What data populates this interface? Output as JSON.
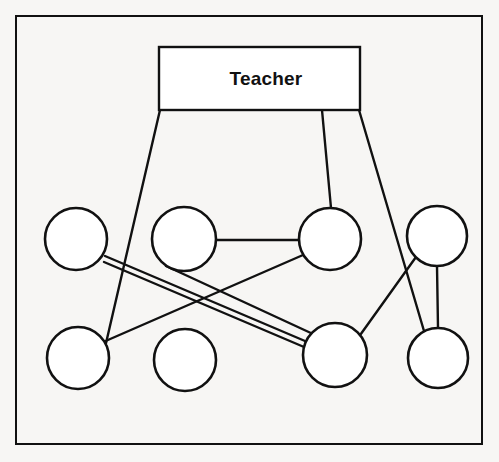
{
  "figure": {
    "kind": "node-link-diagram",
    "background_color": "#f7f6f4",
    "stroke_color": "#111111",
    "fill_color": "#ffffff",
    "border": {
      "x": 16,
      "y": 16,
      "width": 466,
      "height": 428,
      "stroke_width": 2
    }
  },
  "boxes": [
    {
      "id": "teacher",
      "label": "Teacher",
      "x": 159,
      "y": 47,
      "width": 201,
      "height": 63,
      "label_x": 266,
      "label_y": 68,
      "stroke_width": 2.4
    }
  ],
  "circles": [
    {
      "id": "t1",
      "row": "top",
      "index": 1,
      "cx": 76,
      "cy": 239,
      "r": 31,
      "stroke_width": 2.6
    },
    {
      "id": "t2",
      "row": "top",
      "index": 2,
      "cx": 184,
      "cy": 239,
      "r": 32,
      "stroke_width": 2.6
    },
    {
      "id": "t3",
      "row": "top",
      "index": 3,
      "cx": 330,
      "cy": 239,
      "r": 31,
      "stroke_width": 2.6
    },
    {
      "id": "t4",
      "row": "top",
      "index": 4,
      "cx": 437,
      "cy": 236,
      "r": 30,
      "stroke_width": 2.6
    },
    {
      "id": "b1",
      "row": "bottom",
      "index": 1,
      "cx": 78,
      "cy": 358,
      "r": 31,
      "stroke_width": 2.6
    },
    {
      "id": "b2",
      "row": "bottom",
      "index": 2,
      "cx": 185,
      "cy": 360,
      "r": 31,
      "stroke_width": 2.6
    },
    {
      "id": "b3",
      "row": "bottom",
      "index": 3,
      "cx": 335,
      "cy": 355,
      "r": 32,
      "stroke_width": 2.6
    },
    {
      "id": "b4",
      "row": "bottom",
      "index": 4,
      "cx": 438,
      "cy": 358,
      "r": 30,
      "stroke_width": 2.6
    }
  ],
  "edges": [
    {
      "id": "e1",
      "from": "teacher",
      "to": "b1",
      "x1": 160,
      "y1": 110,
      "x2": 97,
      "y2": 382,
      "stroke_width": 2.4
    },
    {
      "id": "e2",
      "from": "teacher",
      "to": "t3",
      "x1": 322,
      "y1": 110,
      "x2": 331,
      "y2": 208,
      "stroke_width": 2.4
    },
    {
      "id": "e3",
      "from": "teacher",
      "to": "b4",
      "x1": 359,
      "y1": 110,
      "x2": 424,
      "y2": 331,
      "stroke_width": 2.4
    },
    {
      "id": "e4",
      "from": "t2",
      "to": "t3",
      "x1": 216,
      "y1": 240,
      "x2": 299,
      "y2": 240,
      "stroke_width": 2.4
    },
    {
      "id": "e5",
      "from": "t1",
      "to": "b3",
      "x1": 105,
      "y1": 256,
      "x2": 305,
      "y2": 341,
      "stroke_width": 2.4
    },
    {
      "id": "e6",
      "from": "t1",
      "to": "b3",
      "x1": 104,
      "y1": 262,
      "x2": 304,
      "y2": 347,
      "stroke_width": 2.4
    },
    {
      "id": "e7",
      "from": "t3",
      "to": "b1",
      "x1": 303,
      "y1": 255,
      "x2": 101,
      "y2": 343,
      "stroke_width": 2.4
    },
    {
      "id": "e8",
      "from": "t2",
      "to": "b3",
      "x1": 166,
      "y1": 266,
      "x2": 313,
      "y2": 334,
      "stroke_width": 2.4
    },
    {
      "id": "e9",
      "from": "t4",
      "to": "b3",
      "x1": 416,
      "y1": 257,
      "x2": 358,
      "y2": 338,
      "stroke_width": 2.4
    },
    {
      "id": "e10",
      "from": "t4",
      "to": "b4",
      "x1": 437,
      "y1": 266,
      "x2": 438,
      "y2": 328,
      "stroke_width": 2.4
    }
  ]
}
